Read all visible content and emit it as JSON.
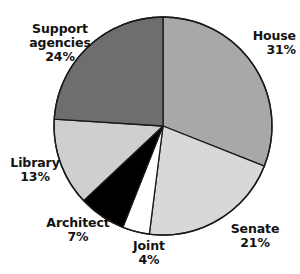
{
  "chart_data": {
    "type": "pie",
    "title": "",
    "subtitle": "",
    "xlabel": "",
    "ylabel": "",
    "legend_position": "none",
    "grid": false,
    "labels_position": "outside",
    "start_angle_deg": 0,
    "direction": "clockwise",
    "units": "percent",
    "categories": [
      "House",
      "Senate",
      "Joint",
      "Architect",
      "Library",
      "Support agencies"
    ],
    "values": [
      31,
      21,
      4,
      7,
      13,
      24
    ],
    "slices": [
      {
        "label": "House",
        "value": 31,
        "value_text": "31%",
        "color": "#a8a8a8"
      },
      {
        "label": "Senate",
        "value": 21,
        "value_text": "21%",
        "color": "#d8d8d8"
      },
      {
        "label": "Joint",
        "value": 4,
        "value_text": "4%",
        "color": "#ffffff"
      },
      {
        "label": "Architect",
        "value": 7,
        "value_text": "7%",
        "color": "#000000"
      },
      {
        "label": "Library",
        "value": 13,
        "value_text": "13%",
        "color": "#cfcfcf"
      },
      {
        "label": "Support agencies",
        "value": 24,
        "value_text": "24%",
        "color": "#6e6e6e"
      }
    ]
  },
  "labels": {
    "house": {
      "name": "House",
      "value": "31%"
    },
    "senate": {
      "name": "Senate",
      "value": "21%"
    },
    "joint": {
      "name": "Joint",
      "value": "4%"
    },
    "architect": {
      "name": "Architect",
      "value": "7%"
    },
    "library": {
      "name": "Library",
      "value": "13%"
    },
    "support": {
      "name_line1": "Support",
      "name_line2": "agencies",
      "value": "24%"
    }
  },
  "style": {
    "background": "#ffffff",
    "outline": "#1a1a1a",
    "text": "#121212"
  }
}
